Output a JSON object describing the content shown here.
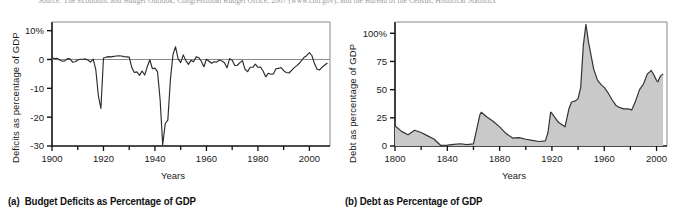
{
  "source_line": "Source: The Economic and Budget Outlook, Congressional Budget Office, 2007 (www.cbo.gov), and the Bureau of the Census, Historical Statistics",
  "panels": [
    {
      "caption_label": "(a)",
      "caption_text": "Budget Deficits as Percentage of GDP"
    },
    {
      "caption_label": "(b)",
      "caption_text": "Debt as Percentage of GDP"
    }
  ],
  "chart_data": [
    {
      "type": "line",
      "title": "Budget Deficits as Percentage of GDP",
      "xlabel": "Years",
      "ylabel": "Deficits as percentage of GDP",
      "xlim": [
        1900,
        2008
      ],
      "ylim": [
        -30,
        13
      ],
      "xticks": [
        1900,
        1920,
        1940,
        1960,
        1980,
        2000
      ],
      "xtick_labels": [
        "1900",
        "1920",
        "1940",
        "1960",
        "1980",
        "2000"
      ],
      "xminor_step": 10,
      "yticks": [
        10,
        0,
        -10,
        -20,
        -30
      ],
      "ytick_labels": [
        "10%",
        "0",
        "-10",
        "-20",
        "-30"
      ],
      "grid": false,
      "zero_line": true,
      "legend": "none",
      "x": [
        1900,
        1901,
        1902,
        1903,
        1904,
        1905,
        1906,
        1907,
        1908,
        1909,
        1910,
        1911,
        1912,
        1913,
        1914,
        1915,
        1916,
        1917,
        1918,
        1919,
        1920,
        1921,
        1922,
        1923,
        1924,
        1925,
        1926,
        1927,
        1928,
        1929,
        1930,
        1931,
        1932,
        1933,
        1934,
        1935,
        1936,
        1937,
        1938,
        1939,
        1940,
        1941,
        1942,
        1943,
        1944,
        1945,
        1946,
        1947,
        1948,
        1949,
        1950,
        1951,
        1952,
        1953,
        1954,
        1955,
        1956,
        1957,
        1958,
        1959,
        1960,
        1961,
        1962,
        1963,
        1964,
        1965,
        1966,
        1967,
        1968,
        1969,
        1970,
        1971,
        1972,
        1973,
        1974,
        1975,
        1976,
        1977,
        1978,
        1979,
        1980,
        1981,
        1982,
        1983,
        1984,
        1985,
        1986,
        1987,
        1988,
        1989,
        1990,
        1991,
        1992,
        1993,
        1994,
        1995,
        1996,
        1997,
        1998,
        1999,
        2000,
        2001,
        2002,
        2003,
        2004,
        2005,
        2006,
        2007
      ],
      "values": [
        0.5,
        0.3,
        0.4,
        -0.2,
        -0.6,
        -0.5,
        0.3,
        0.2,
        -0.9,
        -0.8,
        -0.2,
        0.1,
        0.1,
        0.2,
        -0.3,
        -0.9,
        0.1,
        -3.4,
        -12.5,
        -17.0,
        0.5,
        0.8,
        1.0,
        0.9,
        1.1,
        1.2,
        1.3,
        1.2,
        1.0,
        0.9,
        0.8,
        -2.8,
        -4.5,
        -4.3,
        -5.5,
        -4.0,
        -5.4,
        -2.5,
        -0.1,
        -3.2,
        -3.0,
        -4.3,
        -13.9,
        -29.6,
        -22.2,
        -21.0,
        -7.0,
        1.7,
        4.4,
        0.2,
        -1.1,
        1.6,
        -0.4,
        -1.7,
        -0.3,
        -0.8,
        0.9,
        0.7,
        -0.6,
        -2.5,
        0.1,
        -0.6,
        -1.3,
        -0.8,
        -0.9,
        -0.2,
        -0.5,
        -1.1,
        -2.9,
        0.3,
        -0.3,
        -2.1,
        -2.0,
        -1.1,
        -0.4,
        -3.4,
        -4.2,
        -2.7,
        -2.7,
        -1.6,
        -2.7,
        -2.6,
        -4.0,
        -6.0,
        -4.8,
        -5.1,
        -5.0,
        -3.2,
        -3.1,
        -2.8,
        -3.9,
        -4.5,
        -4.7,
        -3.9,
        -2.9,
        -2.2,
        -1.4,
        -0.3,
        0.8,
        1.4,
        2.4,
        1.3,
        -1.5,
        -3.4,
        -3.6,
        -2.6,
        -1.9,
        -1.2
      ]
    },
    {
      "type": "area",
      "title": "Debt as Percentage of GDP",
      "xlabel": "Years",
      "ylabel": "Debt as percentage of GDP",
      "xlim": [
        1800,
        2008
      ],
      "ylim": [
        0,
        110
      ],
      "xticks": [
        1800,
        1840,
        1880,
        1920,
        1960,
        2000
      ],
      "xtick_labels": [
        "1800",
        "1840",
        "1880",
        "1920",
        "1960",
        "2000"
      ],
      "xminor_step": 20,
      "yticks": [
        0,
        25,
        50,
        75,
        100
      ],
      "ytick_labels": [
        "0",
        "25",
        "50",
        "75",
        "100%"
      ],
      "grid": false,
      "legend": "none",
      "fill_color": "#c9c9c9",
      "line_color": "#333333",
      "x": [
        1800,
        1805,
        1810,
        1815,
        1820,
        1825,
        1830,
        1835,
        1840,
        1845,
        1850,
        1855,
        1860,
        1865,
        1866,
        1870,
        1875,
        1880,
        1885,
        1890,
        1895,
        1900,
        1905,
        1910,
        1915,
        1917,
        1919,
        1920,
        1925,
        1930,
        1933,
        1935,
        1938,
        1940,
        1942,
        1944,
        1946,
        1948,
        1950,
        1952,
        1955,
        1958,
        1960,
        1963,
        1966,
        1969,
        1972,
        1975,
        1978,
        1981,
        1984,
        1987,
        1990,
        1993,
        1996,
        1998,
        2000,
        2001,
        2003,
        2005
      ],
      "values": [
        18.0,
        13.0,
        10.0,
        14.0,
        12.0,
        9.0,
        6.0,
        0.5,
        0.7,
        1.5,
        2.0,
        1.2,
        1.8,
        28.0,
        30.0,
        26.0,
        22.0,
        17.0,
        11.0,
        7.0,
        7.5,
        6.0,
        5.0,
        4.0,
        4.5,
        12.0,
        30.0,
        29.0,
        21.0,
        17.0,
        33.0,
        39.0,
        40.0,
        42.0,
        52.0,
        89.0,
        108.0,
        92.0,
        80.0,
        68.0,
        58.0,
        54.0,
        52.0,
        47.0,
        41.0,
        36.0,
        34.0,
        33.0,
        33.0,
        32.0,
        40.0,
        50.0,
        55.0,
        64.0,
        67.0,
        63.0,
        58.0,
        57.0,
        62.0,
        64.0
      ]
    }
  ]
}
